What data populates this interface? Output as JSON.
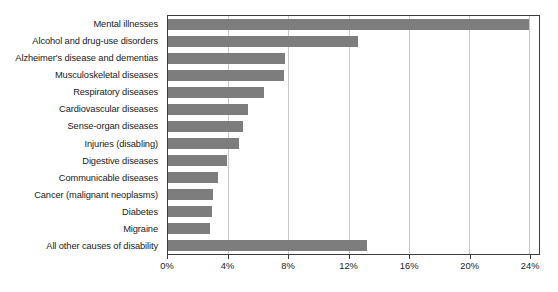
{
  "chart_data": {
    "type": "bar",
    "orientation": "horizontal",
    "title": "",
    "subtitle": "",
    "xlabel": "",
    "ylabel": "",
    "xlim": [
      0,
      24.65
    ],
    "xticks": [
      0,
      4,
      8,
      12,
      16,
      20,
      24
    ],
    "xtick_labels": [
      "0%",
      "4%",
      "8%",
      "12%",
      "16%",
      "20%",
      "24%"
    ],
    "grid": "vertical",
    "legend": "none",
    "bar_color": "#7d7d7d",
    "axis_color": "#3d3d3d",
    "gridline_color": "#c9c9c9",
    "categories": [
      "Mental illnesses",
      "Alcohol and drug-use disorders",
      "Alzheimer's disease and dementias",
      "Musculoskeletal diseases",
      "Respiratory diseases",
      "Cardiovascular diseases",
      "Sense-organ diseases",
      "Injuries (disabling)",
      "Digestive diseases",
      "Communicable diseases",
      "Cancer (malignant neoplasms)",
      "Diabetes",
      "Migraine",
      "All other causes of disability"
    ],
    "values": [
      24.0,
      12.6,
      7.8,
      7.7,
      6.4,
      5.3,
      5.0,
      4.7,
      3.9,
      3.3,
      3.0,
      2.9,
      2.8,
      13.2
    ],
    "value_unit": "%"
  }
}
